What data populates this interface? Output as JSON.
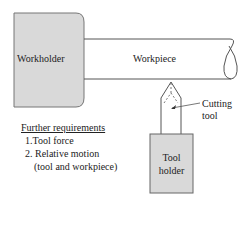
{
  "diagram": {
    "workholder": {
      "label": "Workholder",
      "fill": "#d9d9d9",
      "stroke": "#666666"
    },
    "workpiece": {
      "label": "Workpiece",
      "stroke": "#555555"
    },
    "cutting_tool": {
      "label_line1": "Cutting",
      "label_line2": "tool"
    },
    "tool_holder": {
      "label_line1": "Tool",
      "label_line2": "holder",
      "fill": "#d9d9d9"
    },
    "requirements": {
      "title": "Further requirements",
      "items": [
        {
          "text": "1.Tool force"
        },
        {
          "text": "2. Relative motion"
        },
        {
          "text": "(tool and workpiece)"
        }
      ]
    }
  }
}
